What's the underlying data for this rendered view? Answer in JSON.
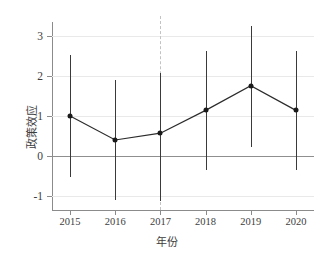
{
  "chart_data": {
    "type": "line",
    "title": "",
    "subtitle": "",
    "xlabel": "年份",
    "ylabel": "政策效应",
    "x": [
      2015,
      2016,
      2017,
      2018,
      2019,
      2020
    ],
    "categories": [
      "2015",
      "2016",
      "2017",
      "2018",
      "2019",
      "2020"
    ],
    "values": [
      1.0,
      0.4,
      0.57,
      1.14,
      1.76,
      1.14
    ],
    "ci_lower": [
      -0.52,
      -1.1,
      -1.13,
      -0.35,
      0.22,
      -0.36
    ],
    "ci_upper": [
      2.52,
      1.9,
      2.07,
      2.63,
      3.24,
      2.63
    ],
    "series": [
      {
        "name": "政策效应",
        "values": [
          1.0,
          0.4,
          0.57,
          1.14,
          1.76,
          1.14
        ],
        "ci_lower": [
          -0.52,
          -1.1,
          -1.13,
          -0.35,
          0.22,
          -0.36
        ],
        "ci_upper": [
          2.52,
          1.9,
          2.07,
          2.63,
          3.24,
          2.63
        ]
      }
    ],
    "ylim": [
      -1.35,
      3.35
    ],
    "xlim": [
      2014.6,
      2020.4
    ],
    "yticks": [
      -1,
      0,
      1,
      2,
      3
    ],
    "ytick_labels": [
      "-1",
      "0",
      "1",
      "2",
      "3"
    ],
    "xticks": [
      2015,
      2016,
      2017,
      2018,
      2019,
      2020
    ],
    "xtick_labels": [
      "2015",
      "2016",
      "2017",
      "2018",
      "2019",
      "2020"
    ],
    "grid": true,
    "grid_axis": "y",
    "legend": false,
    "legend_position": "none",
    "annotations": [
      {
        "type": "vline",
        "name": "reference-year-line",
        "x": 2017,
        "style": "dashed",
        "color": "#c3c3c3"
      },
      {
        "type": "hline",
        "name": "zero-line",
        "y": 0,
        "style": "solid",
        "color": "#8f8f8f"
      }
    ],
    "colors": {
      "line": "#2b2b2b",
      "marker": "#1a1a1a",
      "errorbar": "#3a3a3a",
      "grid": "#e9e9e9",
      "zero_line": "#8f8f8f",
      "reference_line": "#c3c3c3",
      "axis": "#8b8b8b",
      "text": "#3d3d3d",
      "background": "#ffffff"
    }
  },
  "axes": {
    "y_title": "政策效应",
    "x_title": "年份"
  }
}
